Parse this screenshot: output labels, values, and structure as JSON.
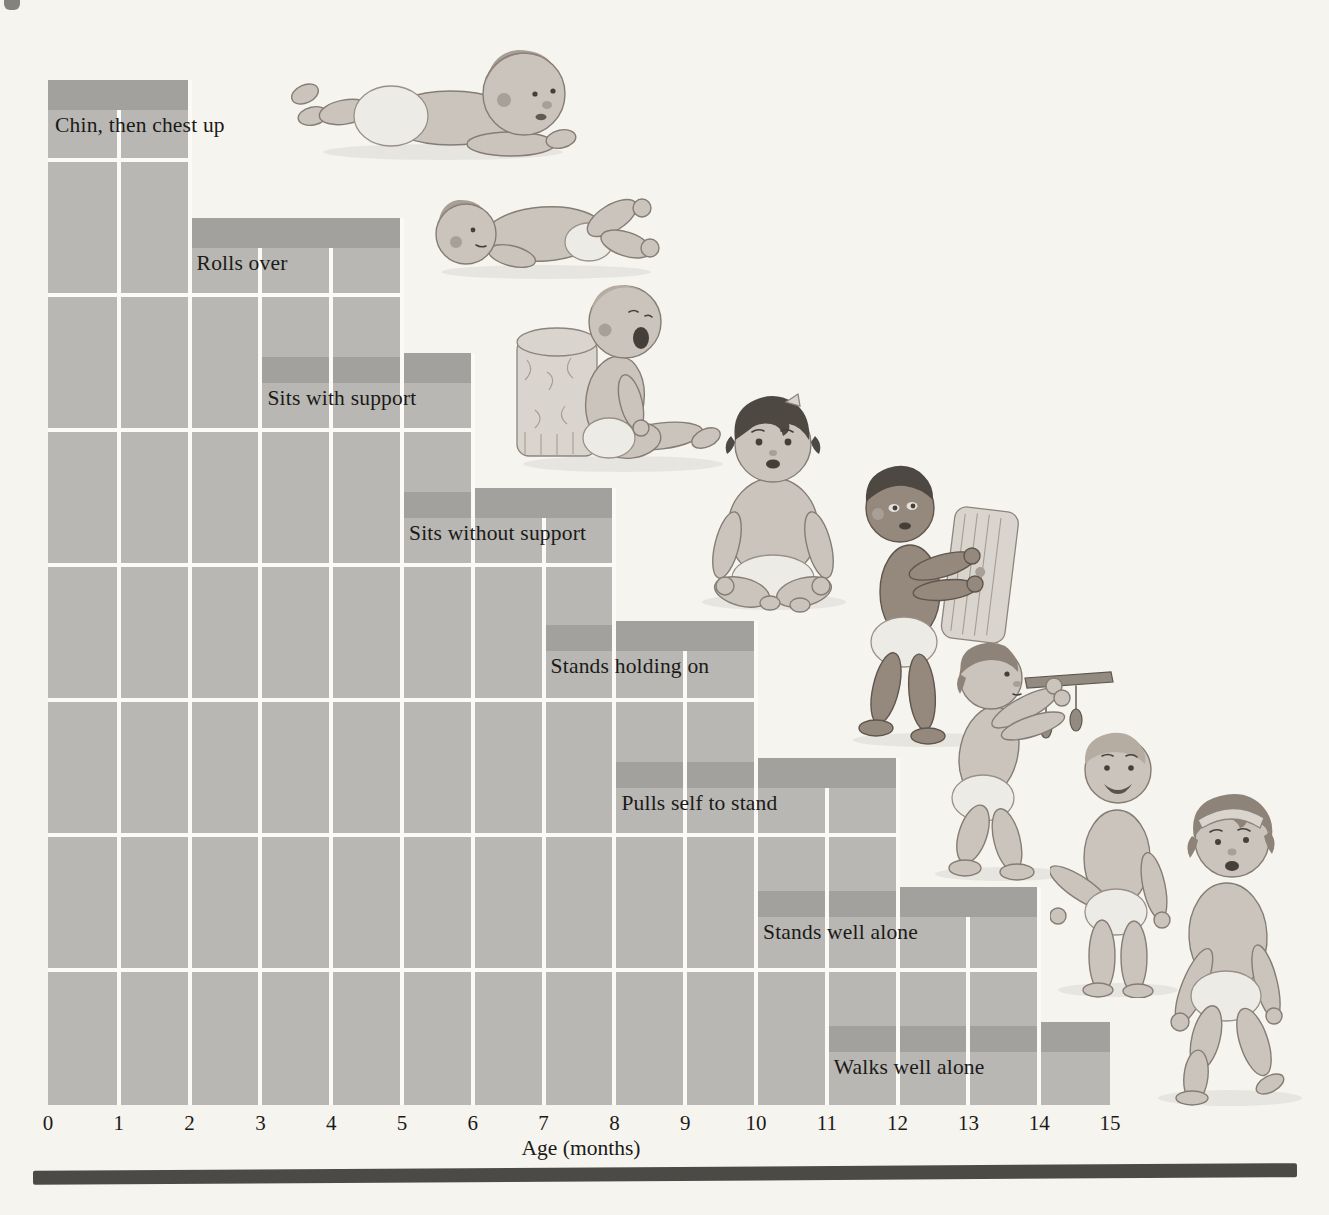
{
  "meta": {
    "background": "#f6f4ef",
    "bottom_rule_color": "#4c4a47"
  },
  "chart_data": {
    "type": "bar",
    "variant": "milestone-range-staircase",
    "title": "",
    "xlabel": "Age (months)",
    "xlim": [
      0,
      15
    ],
    "x_ticks": [
      "0",
      "1",
      "2",
      "3",
      "4",
      "5",
      "6",
      "7",
      "8",
      "9",
      "10",
      "11",
      "12",
      "13",
      "14",
      "15"
    ],
    "grid": true,
    "legend": "none",
    "colors": {
      "bar_fill": "#b8b7b4",
      "band_fill": "#a3a19d",
      "gridline": "#fbfaf6",
      "text": "#1c1a17",
      "background": "#f6f4ef",
      "bottom_rule": "#4c4a47"
    },
    "milestones": [
      {
        "label": "Chin, then chest up",
        "start_month": 0,
        "end_month": 2
      },
      {
        "label": "Rolls over",
        "start_month": 2,
        "end_month": 5
      },
      {
        "label": "Sits with support",
        "start_month": 3,
        "end_month": 6
      },
      {
        "label": "Sits without support",
        "start_month": 5,
        "end_month": 8
      },
      {
        "label": "Stands holding on",
        "start_month": 7,
        "end_month": 10
      },
      {
        "label": "Pulls self to stand",
        "start_month": 8,
        "end_month": 12
      },
      {
        "label": "Stands well alone",
        "start_month": 10,
        "end_month": 14
      },
      {
        "label": "Walks well alone",
        "start_month": 11,
        "end_month": 15
      }
    ],
    "babies": [
      {
        "name": "baby-chin-chest-up",
        "alt": "Infant lying prone lifting chin and chest"
      },
      {
        "name": "baby-rolls-over",
        "alt": "Infant rolling over onto its back"
      },
      {
        "name": "baby-sits-with-support",
        "alt": "Infant sitting propped against a cushion"
      },
      {
        "name": "baby-sits-without-support",
        "alt": "Infant sitting upright without support"
      },
      {
        "name": "baby-stands-holding-on",
        "alt": "Infant standing while holding a chair cushion"
      },
      {
        "name": "baby-pulls-to-stand",
        "alt": "Infant pulling self to stand at a table edge"
      },
      {
        "name": "baby-stands-well-alone",
        "alt": "Toddler standing well alone"
      },
      {
        "name": "baby-walks-well-alone",
        "alt": "Toddler walking well alone"
      }
    ]
  }
}
